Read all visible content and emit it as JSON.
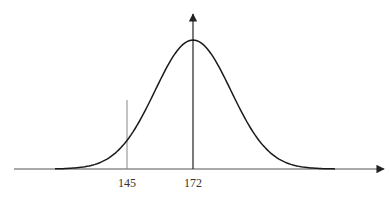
{
  "chart_data": {
    "type": "line",
    "title": "",
    "subtitle": "Normal distribution (bell curve)",
    "xlabel": "",
    "ylabel": "",
    "grid": false,
    "legend": null,
    "distribution": {
      "mean": 172,
      "marked_value": 145
    },
    "tick_labels": [
      "145",
      "172"
    ],
    "annotations": [
      {
        "type": "vertical-line",
        "x": 145,
        "label": "145"
      },
      {
        "type": "axis-arrow",
        "x": 172,
        "label": "172"
      }
    ]
  },
  "labels": {
    "tick_145": "145",
    "tick_172": "172"
  },
  "colors": {
    "curve": "#1a1a1a",
    "axis": "#555555",
    "marker_line": "#888888"
  }
}
